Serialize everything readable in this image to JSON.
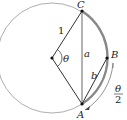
{
  "diagram": {
    "labels": {
      "C": "C",
      "B": "B",
      "A": "A",
      "radius": "1",
      "theta": "θ",
      "a": "a",
      "b": "b",
      "half_num": "θ",
      "half_den": "2"
    },
    "colors": {
      "stroke": "#333333",
      "arc": "#888888",
      "circle": "#999999"
    }
  }
}
